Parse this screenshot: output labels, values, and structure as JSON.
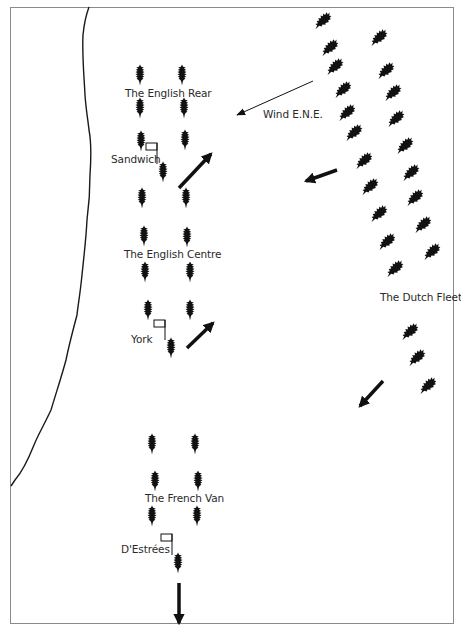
{
  "map": {
    "colors": {
      "ink": "#111111",
      "coast": "#1a1a1a",
      "frame": "#8a8a8a",
      "background": "#ffffff",
      "text": "#2a2a2a"
    },
    "labels": {
      "english_rear": "The English Rear",
      "english_centre": "The English Centre",
      "french_van": "The French Van",
      "dutch_fleet": "The Dutch Fleet",
      "wind": "Wind E.N.E.",
      "sandwich": "Sandwich",
      "york": "York",
      "destrees": "D'Estrées"
    },
    "squadrons": [
      {
        "name": "The English Rear",
        "ships": [
          [
            140,
            75
          ],
          [
            182,
            75
          ],
          [
            140,
            108
          ],
          [
            184,
            108
          ],
          [
            141,
            141
          ],
          [
            185,
            140
          ]
        ],
        "flagship": {
          "name": "Sandwich",
          "pos": [
            163,
            172
          ],
          "flag": [
            152,
            147
          ]
        },
        "arrow": {
          "from": [
            179,
            188
          ],
          "to": [
            211,
            154
          ]
        }
      },
      {
        "name": "The English Centre",
        "ships": [
          [
            142,
            198
          ],
          [
            186,
            198
          ],
          [
            144,
            236
          ],
          [
            187,
            237
          ],
          [
            145,
            272
          ],
          [
            190,
            272
          ],
          [
            148,
            310
          ],
          [
            190,
            310
          ]
        ],
        "flagship": {
          "name": "York",
          "pos": [
            171,
            348
          ],
          "flag": [
            160,
            324
          ]
        },
        "arrow": {
          "from": [
            187,
            348
          ],
          "to": [
            213,
            323
          ]
        }
      },
      {
        "name": "The French Van",
        "ships": [
          [
            152,
            444
          ],
          [
            195,
            444
          ],
          [
            155,
            481
          ],
          [
            198,
            481
          ],
          [
            152,
            516
          ],
          [
            197,
            516
          ]
        ],
        "flagship": {
          "name": "D'Estrées",
          "pos": [
            178,
            563
          ],
          "flag": [
            167,
            538
          ]
        },
        "arrow": {
          "from": [
            179,
            583
          ],
          "to": [
            179,
            623
          ]
        }
      }
    ],
    "dutch_fleet": {
      "name": "The Dutch Fleet",
      "ships": [
        [
          322,
          20
        ],
        [
          378,
          37
        ],
        [
          329,
          47
        ],
        [
          334,
          66
        ],
        [
          385,
          70
        ],
        [
          342,
          89
        ],
        [
          392,
          92
        ],
        [
          346,
          112
        ],
        [
          395,
          118
        ],
        [
          353,
          132
        ],
        [
          404,
          145
        ],
        [
          363,
          160
        ],
        [
          410,
          172
        ],
        [
          369,
          186
        ],
        [
          414,
          197
        ],
        [
          378,
          213
        ],
        [
          422,
          224
        ],
        [
          386,
          241
        ],
        [
          431,
          251
        ],
        [
          394,
          268
        ],
        [
          409,
          331
        ],
        [
          416,
          357
        ],
        [
          427,
          385
        ]
      ],
      "arrows": [
        {
          "from": [
            337,
            170
          ],
          "to": [
            306,
            181
          ]
        },
        {
          "from": [
            383,
            381
          ],
          "to": [
            360,
            406
          ]
        }
      ]
    },
    "wind_arrow": {
      "label": "Wind E.N.E.",
      "from": [
        313,
        81
      ],
      "to": [
        237,
        115
      ]
    }
  }
}
